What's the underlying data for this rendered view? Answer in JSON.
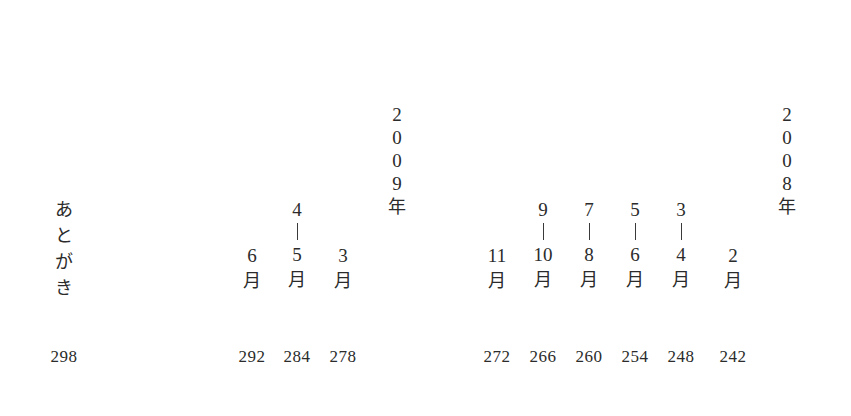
{
  "page": {
    "background_color": "#ffffff",
    "text_color": "#2b2b2b",
    "orientation": "vertical-japanese"
  },
  "section_title": {
    "text": "あとがき",
    "chars": [
      "あ",
      "と",
      "が",
      "き"
    ]
  },
  "years": [
    {
      "label": "2009年",
      "digits": [
        "2",
        "0",
        "0",
        "9"
      ],
      "kanji": "年"
    },
    {
      "label": "2008年",
      "digits": [
        "2",
        "0",
        "0",
        "8"
      ],
      "kanji": "年"
    }
  ],
  "columns": [
    {
      "id": "atogaki",
      "kind": "title",
      "label": "あとがき",
      "page": "298",
      "x": 64,
      "page_x": 64
    },
    {
      "id": "m-6",
      "kind": "month",
      "start": "",
      "dash": false,
      "end": "6",
      "kanji": "月",
      "label": "6月",
      "page": "292",
      "x": 252,
      "page_x": 252
    },
    {
      "id": "m-4-5",
      "kind": "month",
      "start": "4",
      "dash": true,
      "end": "5",
      "kanji": "月",
      "label": "4—5月",
      "page": "284",
      "x": 297,
      "page_x": 297
    },
    {
      "id": "m-3",
      "kind": "month",
      "start": "",
      "dash": false,
      "end": "3",
      "kanji": "月",
      "label": "3月",
      "page": "278",
      "x": 343,
      "page_x": 343
    },
    {
      "id": "year-2009",
      "kind": "year",
      "label": "2009年",
      "x": 396
    },
    {
      "id": "m-11",
      "kind": "month",
      "start": "",
      "dash": false,
      "end": "11",
      "kanji": "月",
      "label": "11月",
      "page": "272",
      "x": 497,
      "page_x": 497
    },
    {
      "id": "m-9-10",
      "kind": "month",
      "start": "9",
      "dash": true,
      "end": "10",
      "kanji": "月",
      "label": "9—10月",
      "page": "266",
      "x": 543,
      "page_x": 543
    },
    {
      "id": "m-7-8",
      "kind": "month",
      "start": "7",
      "dash": true,
      "end": "8",
      "kanji": "月",
      "label": "7—8月",
      "page": "260",
      "x": 589,
      "page_x": 589
    },
    {
      "id": "m-5-6",
      "kind": "month",
      "start": "5",
      "dash": true,
      "end": "6",
      "kanji": "月",
      "label": "5—6月",
      "page": "254",
      "x": 635,
      "page_x": 635
    },
    {
      "id": "m-3-4",
      "kind": "month",
      "start": "3",
      "dash": true,
      "end": "4",
      "kanji": "月",
      "label": "3—4月",
      "page": "248",
      "x": 681,
      "page_x": 681
    },
    {
      "id": "m-2",
      "kind": "month",
      "start": "",
      "dash": false,
      "end": "2",
      "kanji": "月",
      "label": "2月",
      "page": "242",
      "x": 733,
      "page_x": 733
    },
    {
      "id": "year-2008",
      "kind": "year",
      "label": "2008年",
      "x": 786
    }
  ],
  "page_numbers": [
    "298",
    "292",
    "284",
    "278",
    "272",
    "266",
    "260",
    "254",
    "248",
    "242"
  ]
}
